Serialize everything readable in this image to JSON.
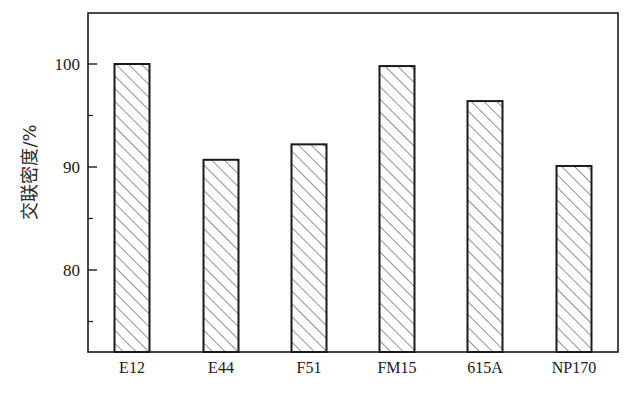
{
  "chart_data": {
    "type": "bar",
    "title": "",
    "xlabel": "",
    "ylabel": "交联密度/%",
    "categories": [
      "E12",
      "E44",
      "F51",
      "FM15",
      "615A",
      "NP170"
    ],
    "values": [
      100.0,
      90.7,
      92.2,
      99.8,
      96.4,
      90.1
    ],
    "ylim": [
      72,
      105
    ],
    "yticks": [
      80,
      90,
      100
    ],
    "yticks_minor": [
      75,
      85,
      95
    ],
    "grid": false,
    "legend": null,
    "bar_fill": "hatched (diagonal lines)",
    "bar_edge_color": "#1a1a1a"
  },
  "axis": {
    "y_tick_labels": [
      "80",
      "90",
      "100"
    ]
  }
}
